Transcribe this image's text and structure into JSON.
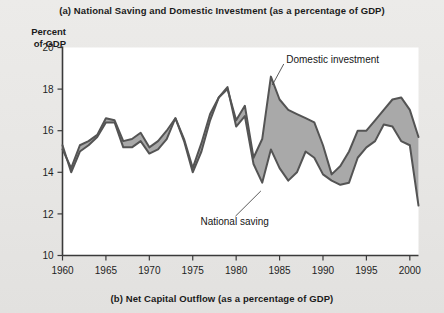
{
  "figure": {
    "caption_top": "(a) National Saving and Domestic Investment (as a percentage of GDP)",
    "caption_bottom": "(b) Net Capital Outflow (as a percentage of GDP)",
    "axis_title_line1": "Percent",
    "axis_title_line2": "of GDP"
  },
  "colors": {
    "background": "#e9e9e7",
    "plot_background": "#ffffff",
    "line": "#545454",
    "fill": "#a9a9a9",
    "axis": "#3a3a3a",
    "text": "#1b1b1b"
  },
  "chart_data": {
    "type": "line",
    "title": "(a) National Saving and Domestic Investment (as a percentage of GDP)",
    "subtitle": "(b) Net Capital Outflow (as a percentage of GDP)",
    "xlabel": "",
    "ylabel": "Percent of GDP",
    "xlim": [
      1960,
      2001
    ],
    "ylim": [
      10,
      20
    ],
    "grid": false,
    "legend_position": "inline-annotation",
    "xticks": [
      1960,
      1965,
      1970,
      1975,
      1980,
      1985,
      1990,
      1995,
      2000
    ],
    "yticks": [
      10,
      12,
      14,
      16,
      18,
      20
    ],
    "x": [
      1960,
      1961,
      1962,
      1963,
      1964,
      1965,
      1966,
      1967,
      1968,
      1969,
      1970,
      1971,
      1972,
      1973,
      1974,
      1975,
      1976,
      1977,
      1978,
      1979,
      1980,
      1981,
      1982,
      1983,
      1984,
      1985,
      1986,
      1987,
      1988,
      1989,
      1990,
      1991,
      1992,
      1993,
      1994,
      1995,
      1996,
      1997,
      1998,
      1999,
      2000,
      2001
    ],
    "series": [
      {
        "name": "Domestic investment",
        "values": [
          15.1,
          14.2,
          15.3,
          15.5,
          15.8,
          16.6,
          16.5,
          15.5,
          15.6,
          15.9,
          15.2,
          15.5,
          16.0,
          16.6,
          15.6,
          14.2,
          15.4,
          16.8,
          17.6,
          18.0,
          16.5,
          17.2,
          14.7,
          15.6,
          18.6,
          17.5,
          17.0,
          16.8,
          16.6,
          16.4,
          15.3,
          13.9,
          14.3,
          15.0,
          16.0,
          16.0,
          16.5,
          17.0,
          17.5,
          17.6,
          17.0,
          15.7
        ]
      },
      {
        "name": "National saving",
        "values": [
          15.3,
          14.0,
          15.0,
          15.3,
          15.7,
          16.4,
          16.4,
          15.2,
          15.2,
          15.5,
          14.9,
          15.1,
          15.6,
          16.6,
          15.5,
          14.0,
          15.0,
          16.5,
          17.6,
          18.1,
          16.2,
          16.7,
          14.4,
          13.5,
          15.1,
          14.2,
          13.6,
          14.0,
          15.0,
          14.7,
          13.9,
          13.6,
          13.4,
          13.5,
          14.7,
          15.2,
          15.5,
          16.3,
          16.2,
          15.5,
          15.3,
          12.4
        ]
      }
    ],
    "annotations": [
      {
        "text": "Domestic investment",
        "x": 1986.0,
        "y": 19.4,
        "points_to": {
          "x": 1984.0,
          "y": 18.2
        }
      },
      {
        "text": "National saving",
        "x": 1976.0,
        "y": 11.6,
        "points_to": {
          "x": 1982.5,
          "y": 13.2
        }
      }
    ]
  }
}
